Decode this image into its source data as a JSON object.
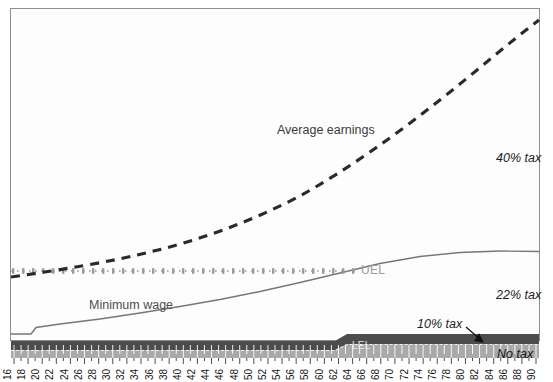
{
  "chart_data": {
    "type": "line",
    "title": "",
    "subtitle": "",
    "xlabel": "",
    "ylabel": "",
    "xlim": [
      16,
      90
    ],
    "ylim": [
      0,
      100
    ],
    "grid": false,
    "legend_position": "inline-annotations",
    "x_tick_labels": [
      "16",
      "18",
      "20",
      "22",
      "24",
      "26",
      "28",
      "30",
      "32",
      "34",
      "36",
      "38",
      "40",
      "42",
      "44",
      "46",
      "48",
      "50",
      "52",
      "54",
      "56",
      "58",
      "60",
      "62",
      "64",
      "66",
      "68",
      "70",
      "72",
      "74",
      "76",
      "78",
      "80",
      "82",
      "84",
      "86",
      "88",
      "90"
    ],
    "y_tick_labels": [],
    "series": [
      {
        "name": "Average earnings",
        "style": "dashed",
        "color": "#2a2a2a",
        "x": [
          16,
          20,
          24,
          28,
          32,
          36,
          40,
          44,
          48,
          52,
          56,
          60,
          64,
          68,
          72,
          76,
          80,
          84,
          88,
          90
        ],
        "values": [
          20.5,
          23.0,
          25.5,
          28.0,
          30.5,
          33.5,
          36.5,
          40.0,
          43.5,
          47.5,
          52.0,
          57.0,
          62.5,
          68.5,
          75.0,
          82.0,
          89.5,
          94.5,
          97.0,
          97.5
        ]
      },
      {
        "name": "UEL",
        "style": "dotted-markers",
        "color": "#999999",
        "x": [
          16,
          90
        ],
        "values": [
          23.5,
          23.5
        ],
        "label_x": 72,
        "note": "Upper Earnings Limit, flat horizontal line; label drawn at right end of marker run"
      },
      {
        "name": "Minimum wage",
        "style": "solid",
        "color": "#777777",
        "x": [
          16,
          20,
          21,
          22,
          24,
          30,
          36,
          42,
          48,
          54,
          60,
          66,
          72,
          78,
          84,
          90
        ],
        "values": [
          2.0,
          2.0,
          2.2,
          4.0,
          4.6,
          5.6,
          6.6,
          7.7,
          9.0,
          10.4,
          12.0,
          13.8,
          15.8,
          18.0,
          20.6,
          23.5
        ]
      },
      {
        "name": "LEL",
        "style": "band-step",
        "color": "#585858",
        "x": [
          16,
          64,
          65,
          90
        ],
        "values": [
          3.0,
          3.0,
          4.6,
          4.6
        ],
        "note": "Lower Earnings Limit: top edge of the dark band, steps up just after 64"
      }
    ],
    "bands": [
      {
        "name": "No tax",
        "fill": "#a9a9a9",
        "from_y": 0,
        "to_y": 3.0
      },
      {
        "name": "LEL band",
        "fill": "#4c4c4c",
        "from_y": 2.2,
        "to_y": 3.4
      }
    ],
    "annotations": [
      {
        "text": "Average earnings",
        "style": "plain",
        "x_px": 277,
        "y_px": 131
      },
      {
        "text": "40% tax",
        "style": "italic",
        "x_px": 496,
        "y_px": 158
      },
      {
        "text": "22% tax",
        "style": "italic",
        "x_px": 496,
        "y_px": 295
      },
      {
        "text": "10% tax",
        "style": "italic",
        "x_px": 423,
        "y_px": 325,
        "arrow": true
      },
      {
        "text": "No tax",
        "style": "italic",
        "x_px": 499,
        "y_px": 355
      },
      {
        "text": "Minimum wage",
        "style": "plain",
        "x_px": 89,
        "y_px": 306
      },
      {
        "text": "UEL",
        "style": "uel",
        "x_px": 361,
        "y_px": 267
      },
      {
        "text": "LEL",
        "style": "lel",
        "x_px": 353,
        "y_px": 345
      }
    ]
  },
  "chart": {
    "annotations": {
      "average_earnings": "Average earnings",
      "tax_40": "40% tax",
      "tax_22": "22% tax",
      "tax_10": "10% tax",
      "no_tax": "No tax",
      "minimum_wage": "Minimum wage",
      "uel": "UEL",
      "lel": "LEL"
    },
    "colors": {
      "average_earnings_line": "#2a2a2a",
      "uel_line": "#999999",
      "minimum_wage_line": "#777777",
      "no_tax_band": "#a9a9a9",
      "lel_band": "#4c4c4c",
      "frame_border": "#8e8e8e",
      "plot_background": "#fdfdfd"
    }
  }
}
